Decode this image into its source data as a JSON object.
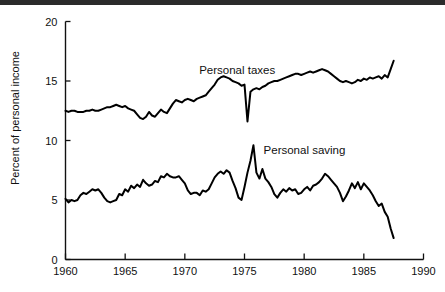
{
  "chart_data": {
    "type": "line",
    "title": "",
    "xlabel": "",
    "ylabel": "Percent of personal income",
    "xlim": [
      1960,
      1990
    ],
    "ylim": [
      0,
      20
    ],
    "xticks": [
      1960,
      1965,
      1970,
      1975,
      1980,
      1985,
      1990
    ],
    "yticks": [
      0,
      5,
      10,
      15,
      20
    ],
    "xtick_labels": [
      "1960",
      "1965",
      "1970",
      "1975",
      "1980",
      "1985",
      "1990"
    ],
    "ytick_labels": [
      "0",
      "5",
      "10",
      "15",
      "20"
    ],
    "grid": false,
    "legend_position": "inline-annotation",
    "annotations": [
      {
        "text": "Personal taxes",
        "x": 1971.2,
        "y": 15.6
      },
      {
        "text": "Personal saving",
        "x": 1976.6,
        "y": 8.9
      }
    ],
    "series": [
      {
        "name": "Personal taxes",
        "color": "#000000",
        "x": [
          1960.0,
          1960.25,
          1960.5,
          1960.75,
          1961.0,
          1961.25,
          1961.5,
          1961.75,
          1962.0,
          1962.25,
          1962.5,
          1962.75,
          1963.0,
          1963.25,
          1963.5,
          1963.75,
          1964.0,
          1964.25,
          1964.5,
          1964.75,
          1965.0,
          1965.25,
          1965.5,
          1965.75,
          1966.0,
          1966.25,
          1966.5,
          1966.75,
          1967.0,
          1967.25,
          1967.5,
          1967.75,
          1968.0,
          1968.25,
          1968.5,
          1968.75,
          1969.0,
          1969.25,
          1969.5,
          1969.75,
          1970.0,
          1970.25,
          1970.5,
          1970.75,
          1971.0,
          1971.25,
          1971.5,
          1971.75,
          1972.0,
          1972.25,
          1972.5,
          1972.75,
          1973.0,
          1973.25,
          1973.5,
          1973.75,
          1974.0,
          1974.25,
          1974.5,
          1974.75,
          1975.0,
          1975.25,
          1975.5,
          1975.75,
          1976.0,
          1976.25,
          1976.5,
          1976.75,
          1977.0,
          1977.25,
          1977.5,
          1977.75,
          1978.0,
          1978.25,
          1978.5,
          1978.75,
          1979.0,
          1979.25,
          1979.5,
          1979.75,
          1980.0,
          1980.25,
          1980.5,
          1980.75,
          1981.0,
          1981.25,
          1981.5,
          1981.75,
          1982.0,
          1982.25,
          1982.5,
          1982.75,
          1983.0,
          1983.25,
          1983.5,
          1983.75,
          1984.0,
          1984.25,
          1984.5,
          1984.75,
          1985.0,
          1985.25,
          1985.5,
          1985.75,
          1986.0,
          1986.25,
          1986.5,
          1986.75,
          1987.0,
          1987.25,
          1987.5
        ],
        "y": [
          12.5,
          12.4,
          12.5,
          12.5,
          12.4,
          12.4,
          12.4,
          12.5,
          12.5,
          12.6,
          12.5,
          12.5,
          12.6,
          12.7,
          12.8,
          12.8,
          12.9,
          13.0,
          12.9,
          12.8,
          12.9,
          12.7,
          12.6,
          12.5,
          12.2,
          11.9,
          11.8,
          12.0,
          12.4,
          12.1,
          12.0,
          12.3,
          12.6,
          12.4,
          12.3,
          12.7,
          13.1,
          13.4,
          13.3,
          13.2,
          13.4,
          13.5,
          13.4,
          13.3,
          13.5,
          13.6,
          13.7,
          13.8,
          14.1,
          14.4,
          14.7,
          15.1,
          15.3,
          15.4,
          15.3,
          15.2,
          15.0,
          14.9,
          14.8,
          14.6,
          14.7,
          11.6,
          14.1,
          14.3,
          14.4,
          14.3,
          14.5,
          14.6,
          14.8,
          14.9,
          15.0,
          15.0,
          15.1,
          15.2,
          15.3,
          15.4,
          15.5,
          15.6,
          15.6,
          15.5,
          15.6,
          15.7,
          15.8,
          15.7,
          15.8,
          15.9,
          16.0,
          15.9,
          15.8,
          15.6,
          15.4,
          15.2,
          15.0,
          14.9,
          15.0,
          14.9,
          14.8,
          14.9,
          15.1,
          15.0,
          15.2,
          15.1,
          15.3,
          15.2,
          15.3,
          15.4,
          15.2,
          15.5,
          15.3,
          16.0,
          16.7
        ]
      },
      {
        "name": "Personal saving",
        "color": "#000000",
        "x": [
          1960.0,
          1960.25,
          1960.5,
          1960.75,
          1961.0,
          1961.25,
          1961.5,
          1961.75,
          1962.0,
          1962.25,
          1962.5,
          1962.75,
          1963.0,
          1963.25,
          1963.5,
          1963.75,
          1964.0,
          1964.25,
          1964.5,
          1964.75,
          1965.0,
          1965.25,
          1965.5,
          1965.75,
          1966.0,
          1966.25,
          1966.5,
          1966.75,
          1967.0,
          1967.25,
          1967.5,
          1967.75,
          1968.0,
          1968.25,
          1968.5,
          1968.75,
          1969.0,
          1969.25,
          1969.5,
          1969.75,
          1970.0,
          1970.25,
          1970.5,
          1970.75,
          1971.0,
          1971.25,
          1971.5,
          1971.75,
          1972.0,
          1972.25,
          1972.5,
          1972.75,
          1973.0,
          1973.25,
          1973.5,
          1973.75,
          1974.0,
          1974.25,
          1974.5,
          1974.75,
          1975.0,
          1975.25,
          1975.5,
          1975.75,
          1976.0,
          1976.25,
          1976.5,
          1976.75,
          1977.0,
          1977.25,
          1977.5,
          1977.75,
          1978.0,
          1978.25,
          1978.5,
          1978.75,
          1979.0,
          1979.25,
          1979.5,
          1979.75,
          1980.0,
          1980.25,
          1980.5,
          1980.75,
          1981.0,
          1981.25,
          1981.5,
          1981.75,
          1982.0,
          1982.25,
          1982.5,
          1982.75,
          1983.0,
          1983.25,
          1983.5,
          1983.75,
          1984.0,
          1984.25,
          1984.5,
          1984.75,
          1985.0,
          1985.25,
          1985.5,
          1985.75,
          1986.0,
          1986.25,
          1986.5,
          1986.75,
          1987.0,
          1987.25,
          1987.5
        ],
        "y": [
          5.1,
          4.8,
          5.0,
          4.9,
          5.0,
          5.4,
          5.6,
          5.5,
          5.7,
          5.9,
          5.8,
          5.9,
          5.6,
          5.2,
          4.9,
          4.8,
          4.9,
          5.0,
          5.5,
          5.4,
          5.9,
          5.7,
          6.2,
          6.0,
          6.3,
          6.1,
          6.7,
          6.4,
          6.2,
          6.3,
          6.6,
          6.5,
          7.0,
          6.9,
          7.2,
          7.0,
          6.9,
          6.9,
          7.0,
          6.7,
          6.4,
          5.8,
          5.5,
          5.6,
          5.6,
          5.4,
          5.8,
          5.7,
          5.9,
          6.4,
          6.9,
          7.2,
          7.4,
          7.2,
          7.5,
          7.3,
          6.6,
          6.0,
          5.2,
          5.0,
          6.1,
          7.3,
          8.3,
          9.6,
          7.3,
          6.8,
          7.6,
          6.8,
          6.5,
          6.1,
          5.5,
          5.2,
          5.6,
          5.9,
          5.7,
          6.0,
          5.8,
          5.9,
          5.5,
          5.6,
          5.9,
          6.1,
          5.8,
          6.2,
          6.3,
          6.5,
          6.8,
          7.2,
          7.0,
          6.7,
          6.4,
          6.1,
          5.6,
          4.9,
          5.3,
          5.8,
          6.4,
          6.0,
          6.5,
          5.9,
          6.4,
          6.1,
          5.8,
          5.4,
          4.9,
          4.5,
          4.7,
          4.0,
          3.6,
          2.6,
          1.8
        ]
      }
    ]
  }
}
